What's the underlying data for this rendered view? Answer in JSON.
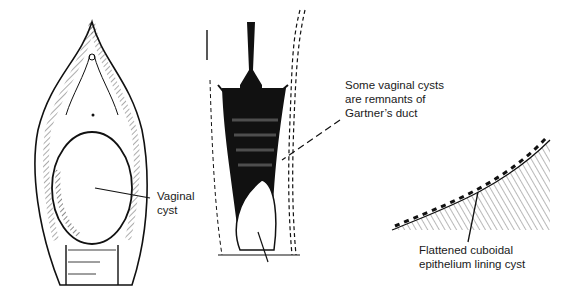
{
  "diagram": {
    "figures": [
      {
        "id": "external-view",
        "description": "Vulva with bulging vaginal cyst"
      },
      {
        "id": "coronal-section",
        "description": "Vagina and cervix section showing cyst along Gartner's duct"
      },
      {
        "id": "histology",
        "description": "Cyst wall lined with flattened cuboidal epithelium"
      }
    ],
    "labels": {
      "vaginal_cyst": "Vaginal\ncyst",
      "gartner": "Some vaginal cysts\nare remnants of\nGartner’s duct",
      "epithelium": "Flattened cuboidal\nepithelium lining cyst"
    },
    "colors": {
      "ink": "#111111",
      "background": "#ffffff"
    }
  }
}
